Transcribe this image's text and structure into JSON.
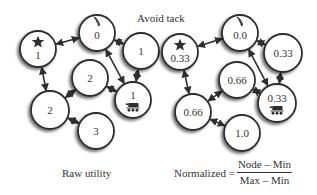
{
  "title": "Avoid tack",
  "colors": {
    "stroke": "#2f2f2f",
    "fill": "#ffffff",
    "shadow": "#9a9a9a",
    "text": "#333333"
  },
  "panels": [
    {
      "id": "raw",
      "caption": "Raw utility",
      "nodes": [
        {
          "id": "star",
          "value": "1",
          "icon": "star-icon",
          "cx": 38,
          "cy": 49,
          "r": 18
        },
        {
          "id": "top",
          "value": "0",
          "icon": "tack-icon",
          "cx": 97,
          "cy": 33,
          "r": 18
        },
        {
          "id": "right",
          "value": "1",
          "icon": null,
          "cx": 141,
          "cy": 51,
          "r": 18
        },
        {
          "id": "mid",
          "value": "2",
          "icon": null,
          "cx": 90,
          "cy": 78,
          "r": 18
        },
        {
          "id": "robot",
          "value": "1",
          "icon": "robot-icon",
          "cx": 133,
          "cy": 100,
          "r": 18
        },
        {
          "id": "left",
          "value": "2",
          "icon": null,
          "cx": 50,
          "cy": 110,
          "r": 19
        },
        {
          "id": "bottom",
          "value": "3",
          "icon": null,
          "cx": 96,
          "cy": 131,
          "r": 18
        }
      ]
    },
    {
      "id": "normalized",
      "caption_prefix": "Normalized =",
      "formula": {
        "numerator": "Node – Min",
        "denominator": "Max – Min"
      },
      "nodes": [
        {
          "id": "star",
          "value": "0.33",
          "icon": "star-icon",
          "cx": 180,
          "cy": 52,
          "r": 18
        },
        {
          "id": "top",
          "value": "0.0",
          "icon": "tack-icon",
          "cx": 240,
          "cy": 33,
          "r": 18
        },
        {
          "id": "right",
          "value": "0.33",
          "icon": null,
          "cx": 283,
          "cy": 53,
          "r": 19
        },
        {
          "id": "mid",
          "value": "0.66",
          "icon": null,
          "cx": 237,
          "cy": 80,
          "r": 18
        },
        {
          "id": "robot",
          "value": "0.33",
          "icon": "robot-icon",
          "cx": 277,
          "cy": 103,
          "r": 19
        },
        {
          "id": "left",
          "value": "0.66",
          "icon": null,
          "cx": 193,
          "cy": 112,
          "r": 18
        },
        {
          "id": "bottom",
          "value": "1.0",
          "icon": null,
          "cx": 242,
          "cy": 133,
          "r": 18
        }
      ]
    }
  ],
  "edges": [
    {
      "from": "top",
      "to": "star"
    },
    {
      "from": "right",
      "to": "top"
    },
    {
      "from": "right",
      "to": "robot"
    },
    {
      "from": "robot",
      "to": "top"
    },
    {
      "from": "robot",
      "to": "mid"
    },
    {
      "from": "mid",
      "to": "left"
    },
    {
      "from": "star",
      "to": "left"
    },
    {
      "from": "bottom",
      "to": "left"
    }
  ]
}
